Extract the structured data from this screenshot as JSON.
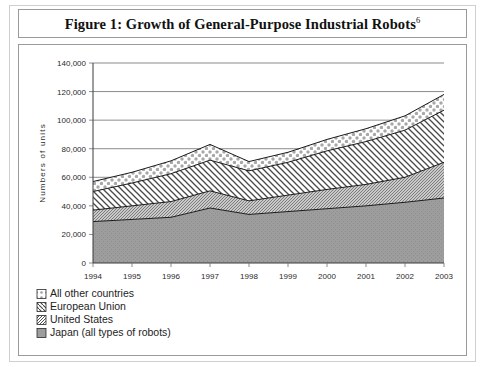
{
  "figure": {
    "title": "Figure 1: Growth of General-Purpose Industrial Robots",
    "title_footnote": "6"
  },
  "chart_data": {
    "type": "area",
    "stacked": true,
    "title": "Figure 1: Growth of General-Purpose Industrial Robots",
    "xlabel": "",
    "ylabel": "Numbers of units",
    "categories": [
      "1994",
      "1995",
      "1996",
      "1997",
      "1998",
      "1999",
      "2000",
      "2001",
      "2002",
      "2003"
    ],
    "x": [
      1994,
      1995,
      1996,
      1997,
      1998,
      1999,
      2000,
      2001,
      2002,
      2003
    ],
    "ylim": [
      0,
      140000
    ],
    "ytick_values": [
      0,
      20000,
      40000,
      60000,
      80000,
      100000,
      120000,
      140000
    ],
    "ytick_labels": [
      "0",
      "20,000",
      "40,000",
      "60,000",
      "80,000",
      "100,000",
      "120,000",
      "140,000"
    ],
    "grid": true,
    "legend_position": "below-left",
    "series": [
      {
        "name": "Japan (all types of robots)",
        "pattern": "solid-gray",
        "values": [
          29000,
          30500,
          32000,
          38500,
          34000,
          36000,
          38000,
          40000,
          42500,
          45500
        ]
      },
      {
        "name": "United States",
        "pattern": "fine-crosshatch",
        "values": [
          8000,
          9500,
          11000,
          12000,
          9500,
          11500,
          13500,
          15000,
          17500,
          25000
        ]
      },
      {
        "name": "European Union",
        "pattern": "backslash-hatch",
        "values": [
          13000,
          16000,
          19500,
          21500,
          21000,
          23000,
          27000,
          30000,
          33000,
          36500
        ]
      },
      {
        "name": "All other countries",
        "pattern": "dotted",
        "values": [
          7000,
          7500,
          9000,
          11000,
          6500,
          7000,
          8000,
          9000,
          10000,
          11000
        ]
      }
    ],
    "cumulative_totals": [
      57000,
      63500,
      71500,
      83000,
      71000,
      77500,
      86500,
      94000,
      103000,
      118000
    ]
  },
  "legend": {
    "items": [
      {
        "label": "All other countries",
        "pattern": "dotted"
      },
      {
        "label": "European Union",
        "pattern": "backslash-hatch"
      },
      {
        "label": "United States",
        "pattern": "fine-crosshatch"
      },
      {
        "label": "Japan (all types of robots)",
        "pattern": "solid-gray"
      }
    ]
  },
  "colors": {
    "japan_fill": "#9a9a9a",
    "us_fill": "#b9b9b9",
    "eu_fill": "#ffffff",
    "other_fill": "#ffffff",
    "line": "#1a1a1a",
    "grid": "#6f6f6f",
    "frame": "#9a9a9a"
  }
}
